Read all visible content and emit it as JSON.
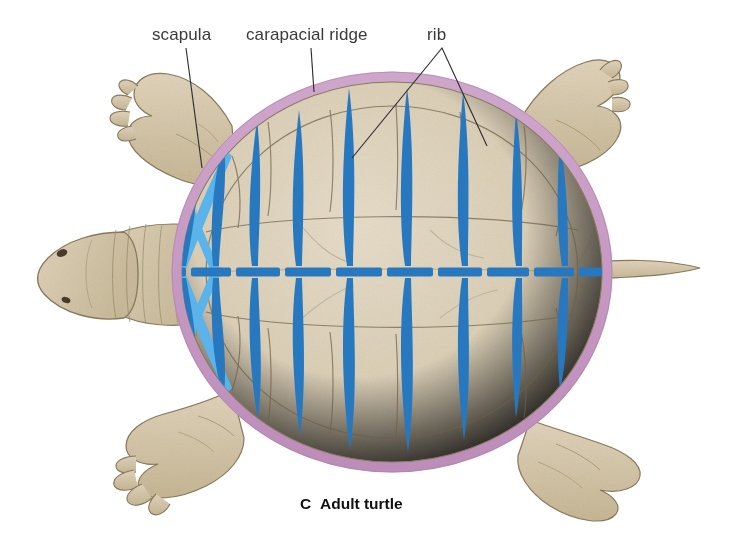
{
  "figure": {
    "panel_letter": "C",
    "panel_title": "Adult turtle",
    "background_color": "#ffffff"
  },
  "labels": [
    {
      "id": "scapula",
      "text": "scapula",
      "x": 152,
      "y": 40,
      "anchor": "start",
      "leader": {
        "type": "line",
        "x1": 186,
        "y1": 48,
        "x2": 202,
        "y2": 168
      }
    },
    {
      "id": "carapacial-ridge",
      "text": "carapacial ridge",
      "x": 246,
      "y": 40,
      "anchor": "start",
      "leader": {
        "type": "line",
        "x1": 311,
        "y1": 48,
        "x2": 314,
        "y2": 92
      }
    },
    {
      "id": "rib",
      "text": "rib",
      "x": 427,
      "y": 40,
      "anchor": "start",
      "leader": {
        "type": "vee",
        "apex_x": 442,
        "apex_y": 48,
        "left_x": 352,
        "left_y": 158,
        "right_x": 487,
        "right_y": 146
      }
    }
  ],
  "colors": {
    "shell_fill": "#d8cbb2",
    "shell_fill_light": "#e2d7c2",
    "shell_outline": "#8a7c63",
    "scute_line": "#6f6048",
    "carapacial_ridge": "#c79cc4",
    "carapacial_ridge_shade": "#b98ab6",
    "rib_blue": "#2878c0",
    "scapula_blue": "#5ab4ea",
    "vertebra_blue": "#2878c0",
    "limb_fill": "#cfc0a4",
    "limb_fill_light": "#ded1b8",
    "limb_outline": "#8a7a5e",
    "head_fill": "#d2c3a7",
    "label_text": "#3a3a3c",
    "caption_text": "#111111",
    "leader_line": "#2e2e30"
  },
  "anatomy": {
    "shell": {
      "shape": "broad oval carapace",
      "center_x": 392,
      "center_y": 272,
      "radius_x": 215,
      "radius_y": 195,
      "ridge_thickness_px": 9
    },
    "vertebral_column": {
      "name": "vertebral column",
      "y": 272,
      "x_start": 148,
      "x_end": 636,
      "thickness_px": 9,
      "segment_count": 11,
      "segment_gap_px": 5
    },
    "ribs": {
      "name": "rib",
      "color": "#2878c0",
      "shape": "elongate lenticular spindle",
      "count_upper": 10,
      "count_lower": 10,
      "total": 20,
      "upper": [
        {
          "x": 180,
          "tip_x": 198,
          "tip_y": 148,
          "len": 120,
          "w": 9
        },
        {
          "x": 213,
          "tip_x": 222,
          "tip_y": 140,
          "len": 128,
          "w": 10
        },
        {
          "x": 252,
          "tip_x": 256,
          "tip_y": 120,
          "len": 150,
          "w": 11
        },
        {
          "x": 296,
          "tip_x": 298,
          "tip_y": 110,
          "len": 160,
          "w": 12
        },
        {
          "x": 347,
          "tip_x": 348,
          "tip_y": 88,
          "len": 182,
          "w": 13
        },
        {
          "x": 405,
          "tip_x": 406,
          "tip_y": 88,
          "len": 182,
          "w": 13
        },
        {
          "x": 462,
          "tip_x": 462,
          "tip_y": 92,
          "len": 178,
          "w": 13
        },
        {
          "x": 516,
          "tip_x": 514,
          "tip_y": 112,
          "len": 158,
          "w": 12
        },
        {
          "x": 562,
          "tip_x": 558,
          "tip_y": 140,
          "len": 130,
          "w": 10
        },
        {
          "x": 606,
          "tip_x": 598,
          "tip_y": 180,
          "len": 90,
          "w": 8
        }
      ],
      "lower": [
        {
          "x": 180,
          "tip_x": 196,
          "tip_y": 378,
          "len": 104,
          "w": 9
        },
        {
          "x": 213,
          "tip_x": 222,
          "tip_y": 398,
          "len": 124,
          "w": 10
        },
        {
          "x": 252,
          "tip_x": 258,
          "tip_y": 420,
          "len": 146,
          "w": 11
        },
        {
          "x": 296,
          "tip_x": 300,
          "tip_y": 436,
          "len": 162,
          "w": 12
        },
        {
          "x": 347,
          "tip_x": 350,
          "tip_y": 450,
          "len": 176,
          "w": 13
        },
        {
          "x": 405,
          "tip_x": 408,
          "tip_y": 452,
          "len": 178,
          "w": 13
        },
        {
          "x": 462,
          "tip_x": 464,
          "tip_y": 440,
          "len": 166,
          "w": 13
        },
        {
          "x": 516,
          "tip_x": 516,
          "tip_y": 418,
          "len": 144,
          "w": 12
        },
        {
          "x": 562,
          "tip_x": 558,
          "tip_y": 392,
          "len": 118,
          "w": 10
        },
        {
          "x": 606,
          "tip_x": 600,
          "tip_y": 356,
          "len": 82,
          "w": 8
        }
      ]
    },
    "scapula": {
      "name": "scapula",
      "color": "#5ab4ea",
      "description": "pale blue X-shaped girdle element at the anterior left of the carapace",
      "upper_arm": {
        "x1": 174,
        "y1": 158,
        "x2": 218,
        "y2": 272,
        "width": 8
      },
      "lower_arm": {
        "x1": 174,
        "y1": 386,
        "x2": 218,
        "y2": 272,
        "width": 8
      },
      "upper_arm2": {
        "x1": 222,
        "y1": 152,
        "x2": 176,
        "y2": 272,
        "width": 7
      },
      "lower_arm2": {
        "x1": 222,
        "y1": 392,
        "x2": 176,
        "y2": 272,
        "width": 7
      }
    },
    "limbs": [
      {
        "id": "forelimb-left",
        "position": "anterior left",
        "has_claws": true,
        "claw_count": 4
      },
      {
        "id": "forelimb-right",
        "position": "anterior right",
        "has_claws": true,
        "claw_count": 3
      },
      {
        "id": "hindlimb-left",
        "position": "posterior left",
        "has_claws": true,
        "claw_count": 4
      },
      {
        "id": "hindlimb-right",
        "position": "posterior right",
        "has_claws": false,
        "claw_count": 0
      }
    ],
    "head": {
      "id": "head",
      "position": "left",
      "features": [
        "nostril",
        "eye",
        "wrinkled neck folds"
      ]
    },
    "tail": {
      "id": "tail",
      "position": "right",
      "shape": "short tapering cone"
    }
  }
}
